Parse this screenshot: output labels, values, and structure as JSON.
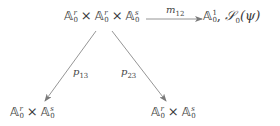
{
  "diagram": {
    "type": "commutative-diagram",
    "nodes": {
      "top": {
        "factors": [
          {
            "base": "𝔸",
            "sup": "r",
            "sub": "0"
          },
          {
            "base": "𝔸",
            "sup": "r",
            "sub": "0"
          },
          {
            "base": "𝔸",
            "sup": "s",
            "sub": "0"
          }
        ],
        "op": "×"
      },
      "right": {
        "base": "𝔸",
        "sup": "1",
        "sub": "0",
        "separator": ",",
        "sheaf": "𝒮",
        "sheaf_sub": "0",
        "sheaf_arg": "(ψ)"
      },
      "bottom_left": {
        "factors": [
          {
            "base": "𝔸",
            "sup": "r",
            "sub": "0"
          },
          {
            "base": "𝔸",
            "sup": "s",
            "sub": "0"
          }
        ],
        "op": "×"
      },
      "bottom_right": {
        "factors": [
          {
            "base": "𝔸",
            "sup": "r",
            "sub": "0"
          },
          {
            "base": "𝔸",
            "sup": "s",
            "sub": "0"
          }
        ],
        "op": "×"
      }
    },
    "arrows": [
      {
        "from": "top",
        "to": "right",
        "label": "m",
        "label_sub": "12"
      },
      {
        "from": "top",
        "to": "bottom_left",
        "label": "p",
        "label_sub": "13"
      },
      {
        "from": "top",
        "to": "bottom_right",
        "label": "p",
        "label_sub": "23"
      }
    ],
    "colors": {
      "text": "#3a3a3a",
      "arrow": "#7a7a7a",
      "background": "#ffffff"
    }
  }
}
